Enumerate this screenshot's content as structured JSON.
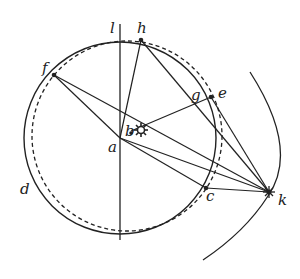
{
  "diagram": {
    "type": "geometric-astronomy-diagram",
    "colors": {
      "stroke": "#222222",
      "background": "#ffffff"
    },
    "labels": {
      "l": "l",
      "h": "h",
      "f": "f",
      "g": "g",
      "e": "e",
      "b": "b",
      "a": "a",
      "d": "d",
      "c": "c",
      "k": "k"
    },
    "points": {
      "a": [
        120,
        138
      ],
      "b": [
        131,
        131
      ],
      "sun": [
        141,
        130
      ],
      "f": [
        54,
        75
      ],
      "h": [
        141,
        40
      ],
      "e": [
        211,
        97
      ],
      "g": [
        190,
        103
      ],
      "c": [
        206,
        188
      ],
      "k": [
        269,
        192
      ]
    },
    "circles": {
      "solid": {
        "cx": 120,
        "cy": 138,
        "r": 96
      },
      "dashed": {
        "cx": 127,
        "cy": 136,
        "r": 95
      }
    },
    "icons": {
      "sun": "sun-icon"
    }
  }
}
